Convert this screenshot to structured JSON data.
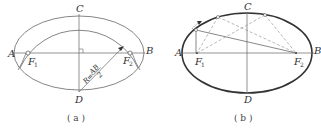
{
  "panel_a": {
    "caption": "( a )",
    "labels": {
      "A": "A",
      "B": "B",
      "C": "C",
      "D": "D",
      "F1": "F",
      "F1_sub": "1",
      "F2": "F",
      "F2_sub": "2"
    },
    "radius_label": "R = AB/2",
    "radius_R": "R",
    "radius_num": "AB",
    "radius_den": "2"
  },
  "panel_b": {
    "caption": "( b )",
    "labels": {
      "A": "A",
      "B": "B",
      "C": "C",
      "D": "D",
      "F1": "F",
      "F1_sub": "1",
      "F2": "F",
      "F2_sub": "2"
    }
  },
  "colors": {
    "stroke": "#555555",
    "thick_stroke": "#333333",
    "dashed": "#888888"
  }
}
